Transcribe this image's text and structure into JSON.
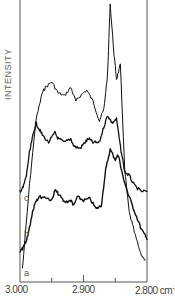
{
  "chart_data": {
    "type": "line",
    "title": "",
    "xlabel": "cm-1",
    "ylabel": "INTENSITY",
    "x_reversed": true,
    "xlim": [
      3000,
      2800
    ],
    "x_ticks": [
      3000,
      2950,
      2900,
      2850,
      2800
    ],
    "x_tick_labels": [
      "3.000",
      "",
      "2.900",
      "",
      "2.800 cm-1"
    ],
    "grid": false,
    "legend": "inline labels a, b, c at left of curves",
    "series_note": "relative intensity (arbitrary units, pixel-estimated, 0 = bottom axis, 100 = top of plot), curves vertically offset",
    "series": [
      {
        "name": "a",
        "x": [
          2996,
          2985,
          2975,
          2965,
          2960,
          2950,
          2940,
          2930,
          2920,
          2912,
          2905,
          2895,
          2885,
          2875,
          2868,
          2862,
          2858,
          2852,
          2848,
          2842,
          2835,
          2828,
          2820,
          2810,
          2803
        ],
        "values": [
          5,
          35,
          58,
          68,
          70,
          72,
          68,
          67,
          70,
          65,
          67,
          69,
          65,
          58,
          62,
          75,
          100,
          82,
          73,
          78,
          40,
          25,
          18,
          10,
          8
        ]
      },
      {
        "name": "b",
        "x": [
          3000,
          2995,
          2990,
          2985,
          2980,
          2975,
          2970,
          2960,
          2950,
          2945,
          2940,
          2930,
          2920,
          2915,
          2910,
          2900,
          2890,
          2880,
          2872,
          2865,
          2858,
          2850,
          2845,
          2840,
          2830,
          2820,
          2810,
          2800
        ],
        "values": [
          8,
          10,
          14,
          22,
          32,
          38,
          40,
          40,
          38,
          44,
          42,
          37,
          38,
          35,
          40,
          38,
          39,
          33,
          35,
          56,
          68,
          62,
          65,
          55,
          42,
          32,
          22,
          15
        ]
      },
      {
        "name": "c",
        "x": [
          3000,
          2995,
          2990,
          2985,
          2980,
          2975,
          2970,
          2965,
          2955,
          2945,
          2940,
          2930,
          2920,
          2915,
          2905,
          2898,
          2892,
          2885,
          2875,
          2868,
          2862,
          2855,
          2848,
          2842,
          2835,
          2828,
          2820,
          2810,
          2800
        ],
        "values": [
          25,
          27,
          33,
          45,
          53,
          60,
          57,
          54,
          50,
          55,
          52,
          50,
          52,
          48,
          47,
          50,
          52,
          50,
          50,
          58,
          64,
          60,
          62,
          48,
          35,
          33,
          28,
          25,
          25
        ]
      }
    ]
  },
  "labels": {
    "ylabel": "INTENSITY",
    "x3000": "3.000",
    "x2900": "2.900",
    "x2800": "2.800 cm",
    "x2800_sup": "-1",
    "curve_a": "a",
    "curve_b": "b",
    "curve_c": "c"
  }
}
